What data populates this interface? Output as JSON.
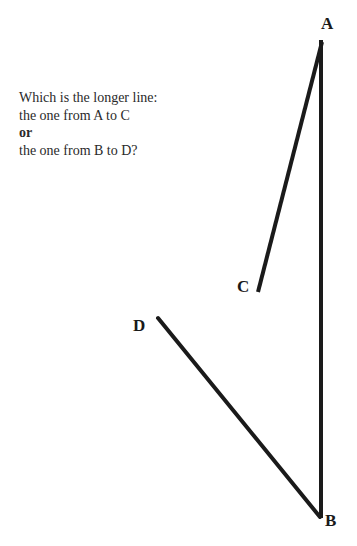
{
  "question": {
    "line1": "Which is the longer line:",
    "line2": "the one from A to C",
    "line3": "or",
    "line4": "the one from B to D?"
  },
  "labels": {
    "A": "A",
    "B": "B",
    "C": "C",
    "D": "D"
  },
  "lines": [
    {
      "name": "A-C",
      "from": [
        322,
        42
      ],
      "to": [
        258,
        292
      ]
    },
    {
      "name": "A-B",
      "from": [
        321,
        42
      ],
      "to": [
        321,
        517
      ]
    },
    {
      "name": "B-D",
      "from": [
        320,
        517
      ],
      "to": [
        158,
        318
      ]
    }
  ],
  "colors": {
    "line": "#1a1a1a",
    "text": "#2a2a2a"
  }
}
